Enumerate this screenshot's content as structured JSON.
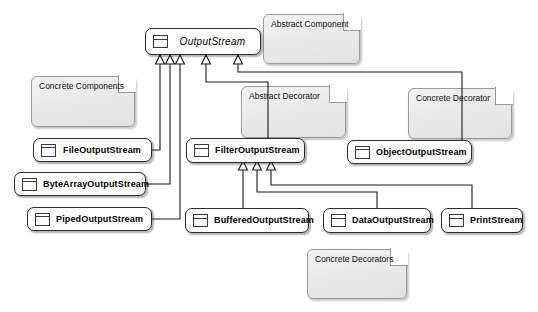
{
  "diagram": {
    "colors": {
      "background": "#ffffff",
      "class_fill": "#ffffff",
      "class_border": "#2b2b2b",
      "note_fill": "#ececec",
      "note_border": "#9a9a9a",
      "connector": "#1a1a1a"
    }
  },
  "classes": {
    "output_stream": {
      "name": "OutputStream",
      "stereotype": "abstract",
      "icon": "uml-class-icon"
    },
    "file_output_stream": {
      "name": "FileOutputStream",
      "icon": "uml-class-icon"
    },
    "byte_array_output_stream": {
      "name": "ByteArrayOutputStream",
      "icon": "uml-class-icon"
    },
    "piped_output_stream": {
      "name": "PipedOutputStream",
      "icon": "uml-class-icon"
    },
    "filter_output_stream": {
      "name": "FilterOutputStream",
      "icon": "uml-class-icon"
    },
    "object_output_stream": {
      "name": "ObjectOutputStream",
      "icon": "uml-class-icon"
    },
    "buffered_output_stream": {
      "name": "BufferedOutputStream",
      "icon": "uml-class-icon"
    },
    "data_output_stream": {
      "name": "DataOutputStream",
      "icon": "uml-class-icon"
    },
    "print_stream": {
      "name": "PrintStream",
      "icon": "uml-class-icon"
    }
  },
  "notes": {
    "abstract_component": {
      "text": "Abstract Component"
    },
    "concrete_components": {
      "text": "Concrete Components"
    },
    "abstract_decorator": {
      "text": "Abstract Decorator"
    },
    "concrete_decorator": {
      "text": "Concrete Decorator"
    },
    "concrete_decorators": {
      "text": "Concrete Decorators"
    }
  },
  "relationships": [
    {
      "type": "generalization",
      "from": "FileOutputStream",
      "to": "OutputStream"
    },
    {
      "type": "generalization",
      "from": "ByteArrayOutputStream",
      "to": "OutputStream"
    },
    {
      "type": "generalization",
      "from": "PipedOutputStream",
      "to": "OutputStream"
    },
    {
      "type": "generalization",
      "from": "FilterOutputStream",
      "to": "OutputStream"
    },
    {
      "type": "generalization",
      "from": "ObjectOutputStream",
      "to": "OutputStream"
    },
    {
      "type": "generalization",
      "from": "BufferedOutputStream",
      "to": "FilterOutputStream"
    },
    {
      "type": "generalization",
      "from": "DataOutputStream",
      "to": "FilterOutputStream"
    },
    {
      "type": "generalization",
      "from": "PrintStream",
      "to": "FilterOutputStream"
    }
  ]
}
